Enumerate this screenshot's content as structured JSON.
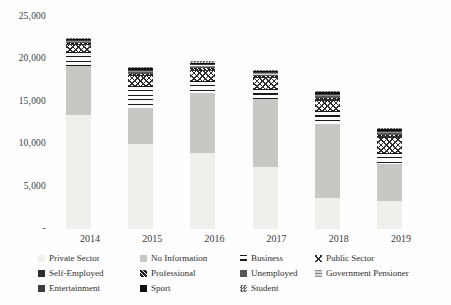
{
  "chart_data": {
    "type": "bar",
    "stacked": true,
    "title": "",
    "xlabel": "",
    "ylabel": "",
    "grid": false,
    "legend_position": "bottom",
    "categories": [
      "2014",
      "2015",
      "2016",
      "2017",
      "2018",
      "2019"
    ],
    "series": [
      {
        "name": "Private Sector",
        "style": "private",
        "values": [
          13400,
          10000,
          9000,
          7250,
          3600,
          3350
        ]
      },
      {
        "name": "No Information",
        "style": "noinfo",
        "values": [
          5750,
          4200,
          7000,
          8050,
          8800,
          4350
        ]
      },
      {
        "name": "Business",
        "style": "business",
        "values": [
          1650,
          2600,
          1400,
          1150,
          1500,
          1300
        ]
      },
      {
        "name": "Public Sector",
        "style": "public",
        "values": [
          800,
          1150,
          1150,
          1300,
          1200,
          1750
        ]
      },
      {
        "name": "Self-Employed",
        "style": "selfemployed",
        "values": [
          120,
          160,
          170,
          135,
          165,
          165
        ]
      },
      {
        "name": "Professional",
        "style": "professional",
        "values": [
          120,
          160,
          170,
          135,
          165,
          165
        ]
      },
      {
        "name": "Unemployed",
        "style": "unemployed",
        "values": [
          120,
          160,
          170,
          135,
          165,
          165
        ]
      },
      {
        "name": "Government Pensioner",
        "style": "govpensioner",
        "values": [
          130,
          160,
          175,
          140,
          165,
          165
        ]
      },
      {
        "name": "Entertainment",
        "style": "entertainment",
        "values": [
          120,
          155,
          170,
          135,
          165,
          165
        ]
      },
      {
        "name": "Sport",
        "style": "sport",
        "values": [
          120,
          155,
          175,
          135,
          165,
          165
        ]
      },
      {
        "name": "Student",
        "style": "student",
        "values": [
          120,
          150,
          170,
          135,
          160,
          160
        ]
      }
    ],
    "totals": [
      22450,
      19050,
      19750,
      18700,
      16250,
      11900
    ],
    "ylim": [
      0,
      25000
    ],
    "ytick_values": [
      0,
      5000,
      10000,
      15000,
      20000,
      25000
    ],
    "ytick_labels": [
      "-",
      "5,000",
      "10,000",
      "15,000",
      "20,000",
      "25,000"
    ]
  }
}
